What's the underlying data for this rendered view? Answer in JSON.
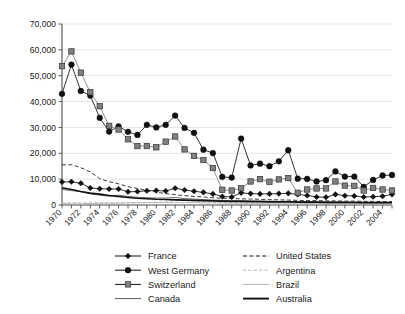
{
  "chart_data": {
    "type": "line",
    "title": "",
    "subtitle": "",
    "xlabel": "",
    "ylabel": "",
    "grid": true,
    "legend_position": "bottom",
    "ylim": [
      0,
      70000
    ],
    "ytick_labels": [
      "0",
      "10,000",
      "20,000",
      "30,000",
      "40,000",
      "50,000",
      "60,000",
      "70,000"
    ],
    "ytick_values": [
      0,
      10000,
      20000,
      30000,
      40000,
      50000,
      60000,
      70000
    ],
    "xlim": [
      1970,
      2005
    ],
    "x": [
      1970,
      1971,
      1972,
      1973,
      1974,
      1975,
      1976,
      1977,
      1978,
      1979,
      1980,
      1981,
      1982,
      1983,
      1984,
      1985,
      1986,
      1987,
      1988,
      1989,
      1990,
      1991,
      1992,
      1993,
      1994,
      1995,
      1996,
      1997,
      1998,
      1999,
      2000,
      2001,
      2002,
      2003,
      2004,
      2005
    ],
    "xtick_labels": [
      "1970",
      "1972",
      "1974",
      "1976",
      "1978",
      "1980",
      "1982",
      "1984",
      "1986",
      "1988",
      "1990",
      "1992",
      "1994",
      "1996",
      "1998",
      "2000",
      "2002",
      "2004"
    ],
    "xtick_values": [
      1970,
      1972,
      1974,
      1976,
      1978,
      1980,
      1982,
      1984,
      1986,
      1988,
      1990,
      1992,
      1994,
      1996,
      1998,
      2000,
      2002,
      2004
    ],
    "series": [
      {
        "name": "France",
        "marker": "diamond",
        "style": "solid",
        "color": "#111111",
        "values": [
          8900,
          9000,
          8400,
          6600,
          6300,
          6200,
          6200,
          5100,
          5200,
          5500,
          5600,
          5400,
          6500,
          5800,
          5300,
          4900,
          4300,
          3300,
          3100,
          4700,
          4400,
          4300,
          4300,
          4400,
          4500,
          4100,
          3700,
          3100,
          3000,
          4100,
          3600,
          3500,
          3100,
          3200,
          3400,
          4100
        ]
      },
      {
        "name": "West Germany",
        "marker": "circle",
        "style": "solid",
        "color": "#111111",
        "values": [
          43000,
          54300,
          44100,
          42300,
          33700,
          28400,
          30400,
          28300,
          27100,
          31000,
          30000,
          31000,
          34600,
          29800,
          27900,
          21400,
          20100,
          10900,
          10600,
          25700,
          15300,
          16000,
          15000,
          16900,
          21200,
          10200,
          10100,
          9100,
          9600,
          13000,
          11000,
          11000,
          7000,
          9700,
          11400,
          11600
        ]
      },
      {
        "name": "Switzerland",
        "marker": "square",
        "style": "solid",
        "color": "#808080",
        "values": [
          53700,
          59400,
          51200,
          43600,
          38200,
          30600,
          29200,
          25400,
          22800,
          22800,
          22300,
          24500,
          26500,
          21500,
          19000,
          17400,
          14300,
          5900,
          5600,
          6500,
          9100,
          10000,
          9000,
          9900,
          10400,
          4700,
          6000,
          6400,
          6400,
          9100,
          7500,
          7400,
          5600,
          6600,
          6000,
          5600
        ]
      },
      {
        "name": "Canada",
        "marker": "none",
        "style": "solid-thin",
        "color": "#595959",
        "values": [
          6000,
          5600,
          5100,
          4300,
          3800,
          3400,
          3800,
          3300,
          3000,
          2800,
          2700,
          2700,
          2900,
          2500,
          2300,
          2100,
          1900,
          1800,
          1700,
          1700,
          1600,
          1500,
          1500,
          1400,
          1400,
          1300,
          1300,
          1200,
          1200,
          1200,
          1100,
          1100,
          1000,
          1000,
          1000,
          1000
        ]
      },
      {
        "name": "United States",
        "marker": "none",
        "style": "dashed",
        "color": "#222222",
        "values": [
          15500,
          15600,
          14400,
          12800,
          10200,
          9000,
          8200,
          7100,
          6400,
          5600,
          5000,
          4400,
          4000,
          3600,
          3300,
          3100,
          2800,
          2600,
          2500,
          2400,
          2300,
          2200,
          2100,
          2000,
          1900,
          1800,
          1700,
          1700,
          1600,
          1600,
          1500,
          1500,
          1400,
          1400,
          1300,
          1300
        ]
      },
      {
        "name": "Argentina",
        "marker": "none",
        "style": "dashed-light",
        "color": "#b3b3b3",
        "values": [
          900,
          900,
          900,
          900,
          900,
          900,
          900,
          900,
          900,
          1000,
          1100,
          1300,
          1600,
          1800,
          1500,
          1200,
          1000,
          900,
          800,
          800,
          800,
          800,
          800,
          800,
          800,
          800,
          700,
          700,
          700,
          700,
          700,
          700,
          600,
          600,
          600,
          600
        ]
      },
      {
        "name": "Brazil",
        "marker": "none",
        "style": "solid-light",
        "color": "#aaaaaa",
        "values": [
          500,
          500,
          500,
          600,
          600,
          700,
          700,
          800,
          800,
          900,
          900,
          900,
          900,
          900,
          900,
          800,
          800,
          800,
          700,
          700,
          700,
          700,
          700,
          700,
          700,
          700,
          600,
          600,
          600,
          600,
          600,
          600,
          500,
          500,
          500,
          500
        ]
      },
      {
        "name": "Australia",
        "marker": "none",
        "style": "solid-thick",
        "color": "#111111",
        "values": [
          6700,
          6000,
          5200,
          4600,
          4200,
          3700,
          3300,
          2900,
          2600,
          2400,
          2200,
          2100,
          2000,
          1900,
          1800,
          1700,
          1600,
          1500,
          1400,
          1400,
          1300,
          1300,
          1200,
          1200,
          1200,
          1100,
          1100,
          1100,
          1000,
          1000,
          1000,
          950,
          900,
          900,
          900,
          900
        ]
      }
    ]
  },
  "legend": {
    "column_left": [
      {
        "label": "France",
        "marker": "diamond",
        "style": "solid"
      },
      {
        "label": "West Germany",
        "marker": "circle",
        "style": "solid"
      },
      {
        "label": "Switzerland",
        "marker": "square",
        "style": "solid"
      },
      {
        "label": "Canada",
        "marker": "none",
        "style": "solid-thin"
      }
    ],
    "column_right": [
      {
        "label": "United States",
        "marker": "none",
        "style": "dashed"
      },
      {
        "label": "Argentina",
        "marker": "none",
        "style": "dashed-light"
      },
      {
        "label": "Brazil",
        "marker": "none",
        "style": "solid-light"
      },
      {
        "label": "Australia",
        "marker": "none",
        "style": "solid-thick"
      }
    ]
  },
  "colors": {
    "series_dark": "#111111",
    "series_grey": "#808080",
    "gridline": "#d9d9d9",
    "axis": "#4d4d4d",
    "background": "#ffffff"
  }
}
